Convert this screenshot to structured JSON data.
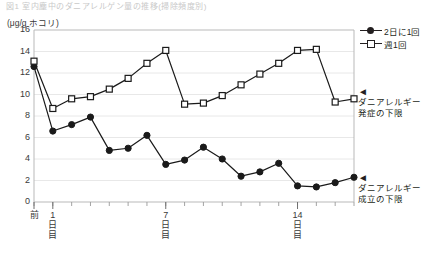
{
  "figure": {
    "faint_header": "図1  室内塵中のダニアレルゲン量の推移(掃除頻度別)",
    "y_axis_unit": "(μg/g ホコリ)"
  },
  "legend": {
    "position": "right-top",
    "items": [
      {
        "label": "2日に1回",
        "marker": "filled-circle-icon"
      },
      {
        "label": "週1回",
        "marker": "open-square-icon"
      }
    ]
  },
  "annotations": [
    {
      "name": "onset-threshold",
      "arrow": "◄",
      "line1": "ダニアレルギー",
      "line2": "発症の下限",
      "value": 10
    },
    {
      "name": "sensitization-threshold",
      "arrow": "◄",
      "line1": "ダニアレルギー",
      "line2": "成立の下限",
      "value": 2
    }
  ],
  "chart_data": {
    "type": "line",
    "title": "",
    "xlabel": "",
    "ylabel": "(μg/g ホコリ)",
    "ylim": [
      0,
      16
    ],
    "yticks": [
      0,
      2,
      4,
      6,
      8,
      10,
      12,
      14,
      16
    ],
    "grid": true,
    "legend_position": "right-top",
    "xticks_major": [
      {
        "index": 0,
        "lines": [
          "前"
        ]
      },
      {
        "index": 1,
        "lines": [
          "1",
          "日",
          "目"
        ]
      },
      {
        "index": 7,
        "lines": [
          "7",
          "日",
          "目"
        ]
      },
      {
        "index": 14,
        "lines": [
          "14",
          "日",
          "目"
        ]
      }
    ],
    "x": [
      0,
      1,
      2,
      3,
      4,
      5,
      6,
      7,
      8,
      9,
      10,
      11,
      12,
      13,
      14,
      15,
      16,
      17
    ],
    "series": [
      {
        "name": "2日に1回",
        "marker": "filled-circle-icon",
        "values": [
          12.6,
          6.6,
          7.2,
          7.9,
          4.8,
          5.0,
          6.2,
          3.5,
          3.9,
          5.1,
          4.0,
          2.4,
          2.8,
          3.6,
          1.5,
          1.4,
          1.8,
          2.3
        ]
      },
      {
        "name": "週1回",
        "marker": "open-square-icon",
        "values": [
          13.1,
          8.7,
          9.6,
          9.8,
          10.5,
          11.5,
          12.9,
          14.1,
          9.1,
          9.2,
          9.9,
          10.9,
          11.9,
          12.9,
          14.1,
          14.2,
          9.3,
          9.6
        ]
      }
    ]
  }
}
